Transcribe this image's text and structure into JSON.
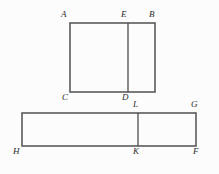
{
  "figure": {
    "background_color": "#fcfcfc",
    "stroke_color": "#5a5a5a",
    "divider_color": "#4e4e4e",
    "label_color": "#2b2b2b",
    "stroke_width": 1.6,
    "divider_width": 1.3,
    "canvas": {
      "width": 219,
      "height": 174
    },
    "shapes": [
      {
        "name": "upper-rectangle",
        "kind": "rectangle",
        "corner_labels": [
          "A",
          "B",
          "D",
          "C"
        ],
        "x": 70,
        "y": 23,
        "width": 85,
        "height": 69,
        "divider": {
          "name": "segment-ED",
          "orientation": "vertical",
          "x": 128,
          "y1": 23,
          "y2": 92,
          "endpoint_labels": [
            "E",
            "D"
          ]
        }
      },
      {
        "name": "lower-rectangle",
        "kind": "rectangle",
        "corner_labels": [
          "H",
          "G",
          "F",
          "K"
        ],
        "x": 22,
        "y": 113,
        "width": 174,
        "height": 33,
        "divider": {
          "name": "segment-LK",
          "orientation": "vertical",
          "x": 138,
          "y1": 113,
          "y2": 146,
          "endpoint_labels": [
            "L",
            "K"
          ]
        }
      }
    ],
    "labels": [
      {
        "id": "A",
        "text": "A",
        "x": 61,
        "y": 10,
        "anchor": "upper-left-of-vertex"
      },
      {
        "id": "E",
        "text": "E",
        "x": 121,
        "y": 10,
        "anchor": "above-divider-top"
      },
      {
        "id": "B",
        "text": "B",
        "x": 149,
        "y": 10,
        "anchor": "upper-right-of-vertex"
      },
      {
        "id": "C",
        "text": "C",
        "x": 62,
        "y": 93,
        "anchor": "below-left-of-vertex"
      },
      {
        "id": "D",
        "text": "D",
        "x": 122,
        "y": 93,
        "anchor": "below-divider-bottom"
      },
      {
        "id": "L",
        "text": "L",
        "x": 133,
        "y": 100,
        "anchor": "above-divider-top"
      },
      {
        "id": "G",
        "text": "G",
        "x": 191,
        "y": 100,
        "anchor": "upper-right-of-vertex"
      },
      {
        "id": "H",
        "text": "H",
        "x": 13,
        "y": 147,
        "anchor": "below-left-of-vertex"
      },
      {
        "id": "K",
        "text": "K",
        "x": 133,
        "y": 147,
        "anchor": "below-divider-bottom"
      },
      {
        "id": "F",
        "text": "F",
        "x": 193,
        "y": 147,
        "anchor": "below-right-of-vertex"
      }
    ]
  }
}
